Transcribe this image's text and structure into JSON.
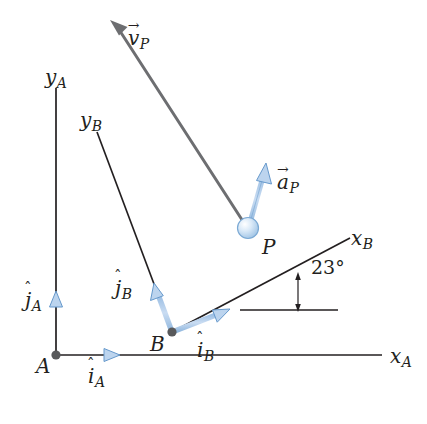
{
  "figure": {
    "type": "kinematics-reference-frame-diagram",
    "background_color": "#ffffff"
  },
  "colors": {
    "vector_blue_fill": "#bcd4ee",
    "vector_blue_edge": "#6699cc",
    "axis_black": "#231f20",
    "gray_vector": "#6d6e71",
    "point_dot": "#58595b",
    "particle_fill": "#cfe2f5",
    "particle_edge": "#7ba9d4",
    "text": "#231f20"
  },
  "points": [
    {
      "name": "A",
      "label": "A",
      "x": 56,
      "y": 355,
      "label_x": 36,
      "label_y": 356
    },
    {
      "name": "B",
      "label": "B",
      "x": 172,
      "y": 332,
      "label_x": 150,
      "label_y": 334
    },
    {
      "name": "P",
      "label": "P",
      "x": 248,
      "y": 228,
      "label_x": 262,
      "label_y": 237
    }
  ],
  "axes": [
    {
      "name": "y-axis-frame-A",
      "label_base": "y",
      "label_sub": "A",
      "label_x": 45,
      "label_y": 67,
      "x1": 56,
      "y1": 88,
      "x2": 56,
      "y2": 355
    },
    {
      "name": "x-axis-frame-A",
      "label_base": "x",
      "label_sub": "A",
      "label_x": 390,
      "label_y": 346,
      "x1": 56,
      "y1": 355,
      "x2": 382,
      "y2": 355
    },
    {
      "name": "y-axis-frame-B",
      "label_base": "y",
      "label_sub": "B",
      "label_x": 80,
      "label_y": 110,
      "x1": 97,
      "y1": 132,
      "x2": 172,
      "y2": 332
    },
    {
      "name": "x-axis-frame-B",
      "label_base": "x",
      "label_sub": "B",
      "label_x": 351,
      "label_y": 228,
      "x1": 172,
      "y1": 332,
      "x2": 350,
      "y2": 238
    }
  ],
  "unit_vectors": [
    {
      "name": "i-hat-A",
      "label_base": "i",
      "label_sub": "A",
      "hat": "ˆ",
      "label_x": 88,
      "label_y": 366,
      "x1": 56,
      "y1": 355,
      "x2": 117,
      "y2": 355
    },
    {
      "name": "j-hat-A",
      "label_base": "j",
      "label_sub": "A",
      "hat": "ˆ",
      "label_x": 25,
      "label_y": 290,
      "x1": 56,
      "y1": 355,
      "x2": 56,
      "y2": 295
    },
    {
      "name": "i-hat-B",
      "label_base": "i",
      "label_sub": "B",
      "hat": "ˆ",
      "label_x": 197,
      "label_y": 340,
      "x1": 172,
      "y1": 332,
      "x2": 229,
      "y2": 310
    },
    {
      "name": "j-hat-B",
      "label_base": "j",
      "label_sub": "B",
      "hat": "ˆ",
      "label_x": 115,
      "label_y": 278,
      "x1": 172,
      "y1": 332,
      "x2": 154,
      "y2": 284
    }
  ],
  "kinematic_vectors": [
    {
      "name": "velocity-P",
      "label_base": "v",
      "label_sub": "P",
      "arrow_accent": "→",
      "label_x": 128,
      "label_y": 28,
      "x1": 248,
      "y1": 228,
      "x2": 112,
      "y2": 22,
      "color": "#6d6e71",
      "style": "gray-long-arrow"
    },
    {
      "name": "acceleration-P",
      "label_base": "a",
      "label_sub": "P",
      "arrow_accent": "→",
      "label_x": 277,
      "label_y": 172,
      "x1": 248,
      "y1": 228,
      "x2": 266,
      "y2": 165,
      "color": "#6699cc",
      "style": "blue-arrow"
    }
  ],
  "angle": {
    "name": "angle-xB-to-horizontal",
    "value": "23°",
    "label_x": 320,
    "label_y": 265,
    "vertex_x": 225,
    "vertex_y": 310,
    "reference_line": {
      "x1": 240,
      "y1": 310,
      "x2": 338,
      "y2": 310
    },
    "arc_x": 298
  }
}
